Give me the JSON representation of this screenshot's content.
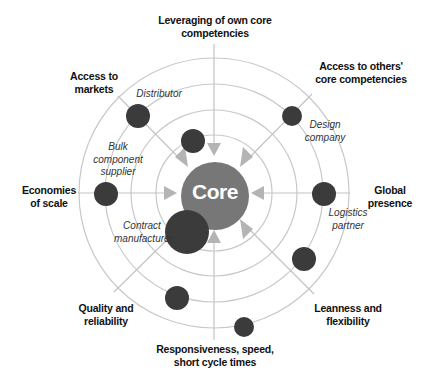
{
  "diagram": {
    "core_label": "Core",
    "colors": {
      "ring": "#c8c8c8",
      "spoke": "#c4c4c4",
      "arrow": "#b4b4b4",
      "core": "#777777",
      "dot": "#3b3b3b",
      "core_text": "#ffffff"
    },
    "benefits": [
      {
        "id": "top",
        "text": "Leveraging of own core competencies"
      },
      {
        "id": "top-right",
        "text": "Access to others' core competencies"
      },
      {
        "id": "right",
        "text": "Global presence"
      },
      {
        "id": "bottom-right",
        "text": "Leanness and flexibility"
      },
      {
        "id": "bottom",
        "text": "Responsiveness, speed, short cycle times"
      },
      {
        "id": "bottom-left",
        "text": "Quality and reliability"
      },
      {
        "id": "left",
        "text": "Economies of scale"
      },
      {
        "id": "top-left",
        "text": "Access to markets"
      }
    ],
    "benefit_lines": {
      "top": [
        "Leveraging of own core",
        "competencies"
      ],
      "top_right": [
        "Access to others'",
        "core competencies"
      ],
      "right": [
        "Global",
        "presence"
      ],
      "bottom_right": [
        "Leanness and",
        "flexibility"
      ],
      "bottom": [
        "Responsiveness, speed,",
        "short cycle times"
      ],
      "bottom_left": [
        "Quality and",
        "reliability"
      ],
      "left": [
        "Economies",
        "of scale"
      ],
      "top_left": [
        "Access to",
        "markets"
      ]
    },
    "partners": {
      "distributor": [
        "Distributor"
      ],
      "bulk_supplier": [
        "Bulk",
        "component",
        "supplier"
      ],
      "contract_manufacturer": [
        "Contract",
        "manufacturer"
      ],
      "design_company": [
        "Design",
        "company"
      ],
      "logistics_partner": [
        "Logistics",
        "partner"
      ]
    },
    "rings_radii": [
      58,
      83,
      109,
      135
    ]
  }
}
